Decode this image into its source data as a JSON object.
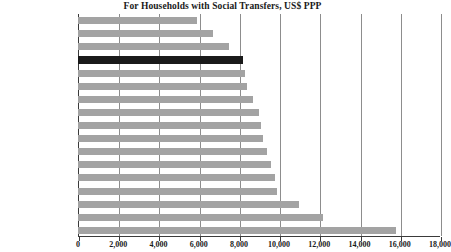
{
  "chart_data": {
    "type": "bar",
    "orientation": "horizontal",
    "title": "For Households with Social Transfers, US$ PPP",
    "xlabel": "",
    "ylabel": "",
    "xlim": [
      0,
      18000
    ],
    "xticks": [
      0,
      2000,
      4000,
      6000,
      8000,
      10000,
      12000,
      14000,
      16000,
      18000
    ],
    "xtick_labels": [
      "0",
      "2,000",
      "4,000",
      "6,000",
      "8,000",
      "10,000",
      "12,000",
      "14,000",
      "16,000",
      "18,000"
    ],
    "grid": true,
    "grid_axis": "x",
    "legend": false,
    "categories": [
      "Ireland",
      "United Kingdom",
      "Greece",
      "United States",
      "Finland",
      "Spain",
      "Netherlands",
      "Germany",
      "Switzerland",
      "France",
      "Austria",
      "Norway",
      "Sweden",
      "Belgium",
      "Denmark",
      "Italy",
      "Luxembourg"
    ],
    "values": [
      5900,
      6700,
      7500,
      8200,
      8300,
      8400,
      8700,
      9000,
      9100,
      9200,
      9400,
      9600,
      9800,
      9900,
      11000,
      12200,
      15800
    ],
    "highlight_category": "United States",
    "colors": {
      "bar": "#a3a3a3",
      "bar_highlight": "#1a1a1a",
      "gridline": "#8d8d8d",
      "axis": "#3a3a3a",
      "text": "#1a1a1a",
      "background": "#ffffff"
    }
  }
}
